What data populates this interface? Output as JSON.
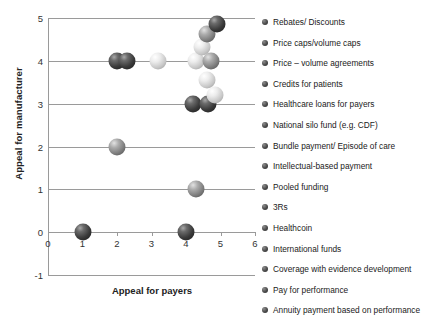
{
  "chart_data": {
    "type": "scatter",
    "title": "",
    "xlabel": "Appeal for payers",
    "ylabel": "Appeal for manufacturer",
    "xlim": [
      0,
      6
    ],
    "ylim": [
      -1,
      5
    ],
    "xticks": [
      0,
      1,
      2,
      3,
      4,
      5,
      6
    ],
    "yticks": [
      -1,
      0,
      1,
      2,
      3,
      4,
      5
    ],
    "grid": true,
    "legend_position": "right",
    "points": [
      {
        "label": "Rebates/ Discounts",
        "x": 1,
        "y": 0,
        "shade": "dark"
      },
      {
        "label": "Price caps/volume caps",
        "x": 2,
        "y": 2,
        "shade": "mid"
      },
      {
        "label": "Price – volume agreements",
        "x": 2,
        "y": 4,
        "shade": "dark"
      },
      {
        "label": "Credits for patients",
        "x": 2.3,
        "y": 4,
        "shade": "dark"
      },
      {
        "label": "Healthcare loans for payers",
        "x": 3.2,
        "y": 4,
        "shade": "light"
      },
      {
        "label": "National silo fund (e.g. CDF)",
        "x": 4,
        "y": 0,
        "shade": "dark"
      },
      {
        "label": "Bundle payment/ Episode of care",
        "x": 4.3,
        "y": 1,
        "shade": "mid"
      },
      {
        "label": "Intellectual-based payment",
        "x": 4.2,
        "y": 3,
        "shade": "dark"
      },
      {
        "label": "Pooled funding",
        "x": 4.65,
        "y": 3,
        "shade": "dark"
      },
      {
        "label": "3Rs",
        "x": 4.62,
        "y": 3.55,
        "shade": "light"
      },
      {
        "label": "Healthcoin",
        "x": 4.85,
        "y": 3.2,
        "shade": "light"
      },
      {
        "label": "International funds",
        "x": 4.3,
        "y": 4.0,
        "shade": "light"
      },
      {
        "label": "Coverage with evidence development",
        "x": 4.72,
        "y": 4.0,
        "shade": "mid"
      },
      {
        "label": "Pay for performance",
        "x": 4.45,
        "y": 4.32,
        "shade": "light"
      },
      {
        "label": "Annuity payment based on performance",
        "x": 4.62,
        "y": 4.62,
        "shade": "mid"
      },
      {
        "label": "Extra point",
        "x": 4.9,
        "y": 4.85,
        "shade": "dark"
      }
    ],
    "legend": [
      "Rebates/ Discounts",
      "Price caps/volume caps",
      "Price – volume agreements",
      "Credits for patients",
      "Healthcare loans for payers",
      "National silo fund (e.g. CDF)",
      "Bundle payment/ Episode of care",
      "Intellectual-based payment",
      "Pooled funding",
      "3Rs",
      "Healthcoin",
      "International funds",
      "Coverage with evidence development",
      "Pay for performance",
      "Annuity payment based on performance"
    ]
  }
}
